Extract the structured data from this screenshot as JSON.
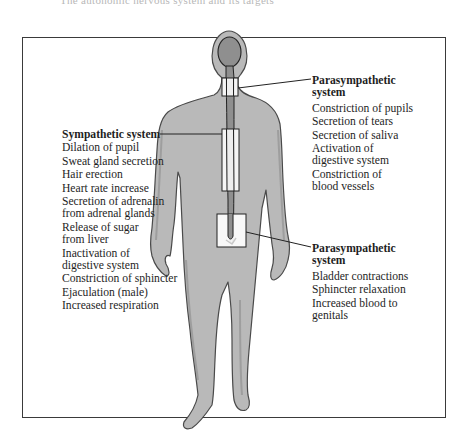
{
  "page": {
    "top_cut_text": "The autonomic nervous system and its targets"
  },
  "labels": {
    "parasympathetic_top": {
      "heading_line1": "Parasympathetic",
      "heading_line2": "system",
      "items": [
        [
          "Constriction of pupils"
        ],
        [
          "Secretion of tears"
        ],
        [
          "Secretion of saliva"
        ],
        [
          "Activation of",
          "digestive system"
        ],
        [
          "Constriction of",
          "blood vessels"
        ]
      ]
    },
    "sympathetic": {
      "heading": "Sympathetic system",
      "items": [
        [
          "Dilation of pupil"
        ],
        [
          "Sweat gland secretion"
        ],
        [
          "Hair erection"
        ],
        [
          "Heart rate increase"
        ],
        [
          "Secretion of adrenalin",
          "from adrenal glands"
        ],
        [
          "Release of sugar",
          "from liver"
        ],
        [
          "Inactivation of",
          "digestive system"
        ],
        [
          "Constriction of sphincter"
        ],
        [
          "Ejaculation (male)"
        ],
        [
          "Increased respiration"
        ]
      ]
    },
    "parasympathetic_bottom": {
      "heading_line1": "Parasympathetic",
      "heading_line2": "system",
      "items": [
        [
          "Bladder contractions"
        ],
        [
          "Sphincter relaxation"
        ],
        [
          "Increased blood to",
          "genitals"
        ]
      ]
    }
  },
  "colors": {
    "body_fill": "#b9b9b9",
    "body_outline": "#4a4a4a",
    "brain_fill": "#8f8f8f",
    "frame": "#3a3a3a",
    "region_box_fill": "#ffffff"
  }
}
